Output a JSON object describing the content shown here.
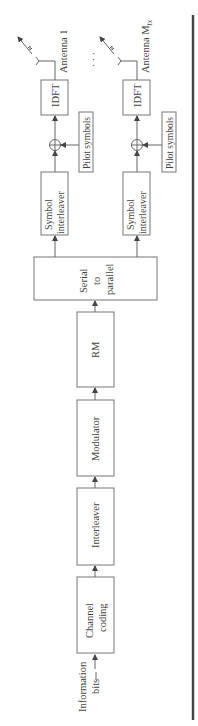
{
  "diagram": {
    "input_label": [
      "Information",
      "bits"
    ],
    "chain": [
      {
        "id": "channel-coding",
        "label": [
          "Channel",
          "coding"
        ]
      },
      {
        "id": "interleaver",
        "label": [
          "Interleaver"
        ]
      },
      {
        "id": "modulator",
        "label": [
          "Modulator"
        ]
      },
      {
        "id": "rm",
        "label": [
          "RM"
        ]
      },
      {
        "id": "serial-to-parallel",
        "label": [
          "Serial",
          "to",
          "parallel"
        ]
      }
    ],
    "branches": [
      {
        "symbol_interleaver": [
          "Symbol",
          "interleaver"
        ],
        "pilot": "Pilot symbols",
        "adder": "⊕",
        "idft": "IDFT",
        "antenna": "Antenna 1"
      },
      {
        "symbol_interleaver": [
          "Symbol",
          "interleaver"
        ],
        "pilot": "Pilot symbols",
        "adder": "⊕",
        "idft": "IDFT",
        "antenna": "Antenna M",
        "antenna_subscript": "tx"
      }
    ],
    "ellipsis": "· · ·",
    "colors": {
      "stroke": "#777777",
      "text": "#444444",
      "rule": "#444444"
    }
  }
}
